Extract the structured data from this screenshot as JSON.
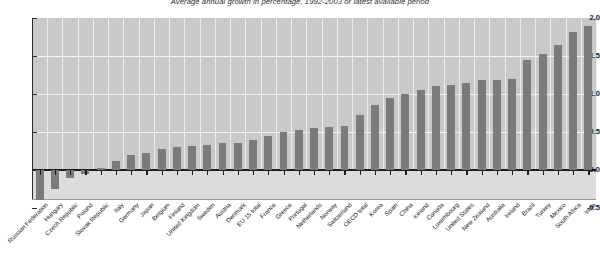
{
  "chart_data": {
    "type": "bar",
    "title": "Average annual growth in percentage, 1992-2003 or latest available period",
    "xlabel": "",
    "ylabel": "",
    "ylim": [
      -0.5,
      2.0
    ],
    "yticks": [
      "-0.5",
      "0.0",
      "0.5",
      "1.0",
      "1.5",
      "2.0"
    ],
    "grid": true,
    "legend": "none",
    "bar_color": "#7b7b7b",
    "plot_bg": "#c9c9c9",
    "categories": [
      "Russian Federation",
      "Hungary",
      "Czech Republic",
      "Poland",
      "Slovak Republic",
      "Italy",
      "Germany",
      "Japan",
      "Belgium",
      "Finland",
      "United Kingdom",
      "Sweden",
      "Austria",
      "Denmark",
      "EU 15 total",
      "France",
      "Greece",
      "Portugal",
      "Netherlands",
      "Norway",
      "Switzerland",
      "OECD total",
      "Korea",
      "Spain",
      "China",
      "Iceland",
      "Canada",
      "Luxembourg",
      "United States",
      "New Zealand",
      "Australia",
      "Ireland",
      "Brazil",
      "Turkey",
      "Mexico",
      "South Africa",
      "India"
    ],
    "values": [
      -0.4,
      -0.25,
      -0.1,
      -0.05,
      0.02,
      0.12,
      0.2,
      0.22,
      0.28,
      0.3,
      0.31,
      0.33,
      0.35,
      0.36,
      0.4,
      0.45,
      0.5,
      0.52,
      0.55,
      0.57,
      0.58,
      0.72,
      0.85,
      0.95,
      1.0,
      1.05,
      1.1,
      1.12,
      1.15,
      1.18,
      1.18,
      1.2,
      1.45,
      1.52,
      1.65,
      1.82,
      1.9
    ]
  }
}
